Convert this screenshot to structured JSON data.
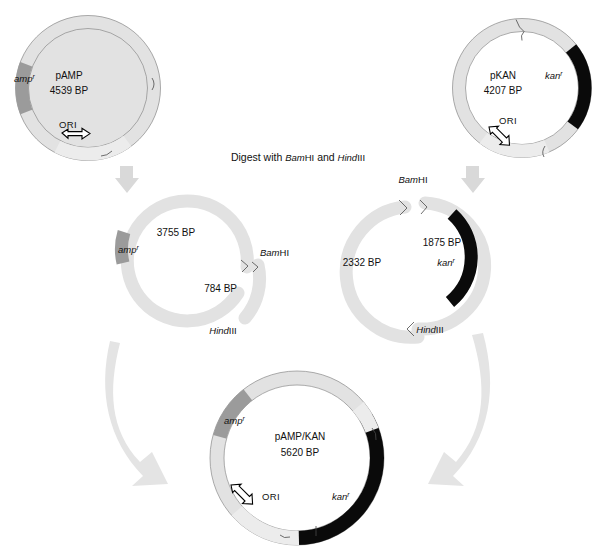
{
  "figure": {
    "title_step": {
      "prefix_italic": "Bam",
      "full_text": "Digest with BamHI and HindIII",
      "part1": "Digest with ",
      "enz1_italic": "Bam",
      "enz1_roman": "HI",
      "part2": " and ",
      "enz2_italic": "Hind",
      "enz2_roman": "III"
    },
    "colors": {
      "backbone_light": "#e2e2e2",
      "amp_segment": "#9b9b9b",
      "kan_segment": "#0a0a0a",
      "ori_pale": "#ececec",
      "arrow_gray": "#e4e4e4",
      "outline": "#8a8a8a",
      "text": "#111111"
    },
    "plasmids": [
      {
        "id": "pamp",
        "name": "pAMP",
        "size": "4539 BP",
        "genes": [
          {
            "label_italic": "amp",
            "label_sup": "r"
          }
        ],
        "ori_label": "ORI",
        "position": "top-left"
      },
      {
        "id": "pkan",
        "name": "pKAN",
        "size": "4207 BP",
        "genes": [
          {
            "label_italic": "kan",
            "label_sup": "r"
          }
        ],
        "ori_label": "ORI",
        "position": "top-right"
      },
      {
        "id": "pampkan",
        "name": "pAMP/KAN",
        "size": "5620 BP",
        "genes": [
          {
            "label_italic": "amp",
            "label_sup": "r"
          },
          {
            "label_italic": "kan",
            "label_sup": "r"
          }
        ],
        "ori_label": "ORI",
        "position": "bottom-center"
      }
    ],
    "digests": [
      {
        "id": "amp-digest",
        "position": "middle-left",
        "fragments": [
          {
            "size": "3755 BP",
            "gene_italic": "amp",
            "gene_sup": "r"
          },
          {
            "size": "784 BP",
            "gene_italic": "",
            "gene_sup": ""
          }
        ],
        "cut_sites": [
          {
            "italic": "Bam",
            "roman": "HI"
          },
          {
            "italic": "Hind",
            "roman": "III"
          }
        ]
      },
      {
        "id": "kan-digest",
        "position": "middle-right",
        "fragments": [
          {
            "size": "2332 BP",
            "gene_italic": "",
            "gene_sup": ""
          },
          {
            "size": "1875 BP",
            "gene_italic": "kan",
            "gene_sup": "r"
          }
        ],
        "cut_sites": [
          {
            "italic": "Bam",
            "roman": "HI"
          },
          {
            "italic": "Hind",
            "roman": "III"
          }
        ]
      }
    ]
  }
}
